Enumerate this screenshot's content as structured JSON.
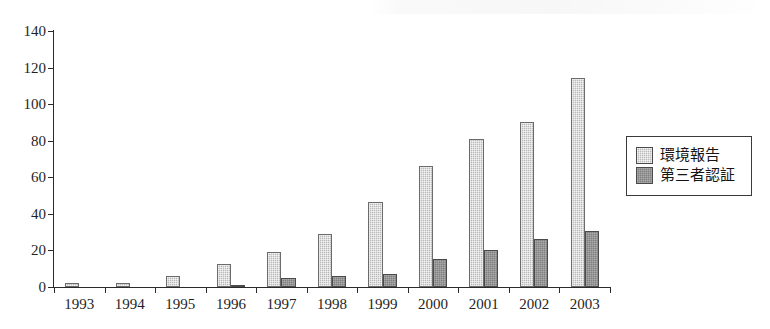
{
  "chart_data": {
    "type": "bar",
    "title": "",
    "subtitle": "",
    "xlabel": "",
    "ylabel": "",
    "ylim": [
      0,
      140
    ],
    "ytick_step": 20,
    "yticks": [
      0,
      20,
      40,
      60,
      80,
      100,
      120,
      140
    ],
    "grid": false,
    "legend_position": "right",
    "categories": [
      "1993",
      "1994",
      "1995",
      "1996",
      "1997",
      "1998",
      "1999",
      "2000",
      "2001",
      "2002",
      "2003"
    ],
    "series": [
      {
        "name": "環境報告",
        "color": "#b9b9b9",
        "values": [
          2,
          2,
          6,
          12.5,
          19,
          29,
          46.5,
          66,
          81,
          90.5,
          114.5
        ]
      },
      {
        "name": "第三者認証",
        "color": "#808080",
        "values": [
          0,
          0,
          0,
          1,
          5,
          6,
          7,
          15.5,
          20.5,
          26,
          30.5
        ]
      }
    ]
  },
  "axes": {
    "y_tick_labels": [
      "0",
      "20",
      "40",
      "60",
      "80",
      "100",
      "120",
      "140"
    ],
    "x_tick_labels": [
      "1993",
      "1994",
      "1995",
      "1996",
      "1997",
      "1998",
      "1999",
      "2000",
      "2001",
      "2002",
      "2003"
    ]
  },
  "legend": {
    "entries": [
      {
        "label": "環境報告",
        "swatch": "light-gray-hatched-swatch"
      },
      {
        "label": "第三者認証",
        "swatch": "dark-gray-hatched-swatch"
      }
    ]
  },
  "colors": {
    "series_light": "#b9b9b9",
    "series_dark": "#808080",
    "axis": "#2b2b2b",
    "background": "#ffffff"
  }
}
